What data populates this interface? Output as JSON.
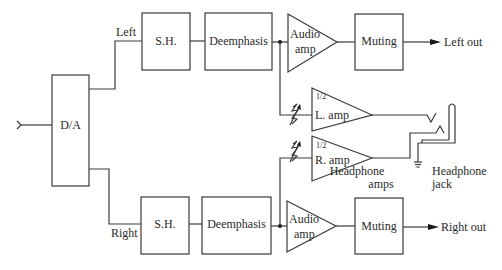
{
  "diagram": {
    "type": "block-diagram",
    "input": {
      "label": ""
    },
    "da_converter": {
      "label": "D/A"
    },
    "channels": {
      "left": {
        "wire_label": "Left",
        "sample_hold": "S.H.",
        "deemphasis": "Deemphasis",
        "audio_amp": [
          "Audio",
          "amp"
        ],
        "muting": "Muting",
        "output": "Left out"
      },
      "right": {
        "wire_label": "Right",
        "sample_hold": "S.H.",
        "deemphasis": "Deemphasis",
        "audio_amp": [
          "Audio",
          "amp"
        ],
        "muting": "Muting",
        "output": "Right out"
      }
    },
    "headphone": {
      "left_amp": {
        "fraction": "1/2",
        "label": "L. amp"
      },
      "right_amp": {
        "fraction": "1/2",
        "label": "R. amp"
      },
      "amps_label": [
        "Headphone",
        "amps"
      ],
      "jack_label": [
        "Headphone",
        "jack"
      ]
    },
    "colors": {
      "line": "#3a3a3a",
      "text": "#2a2a2a",
      "background": "#ffffff"
    }
  }
}
